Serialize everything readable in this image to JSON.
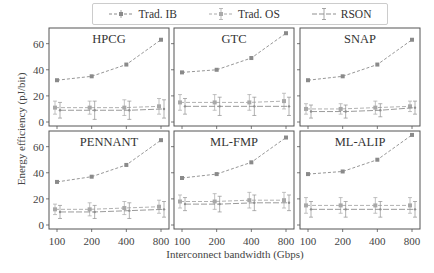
{
  "chart_data": {
    "type": "line",
    "layout": "2x3 small multiples",
    "xlabel": "Interconnect bandwidth (Gbps)",
    "ylabel": "Energy efficiency (pJ/bit)",
    "x": [
      100,
      200,
      400,
      800
    ],
    "xticks": [
      "100",
      "200",
      "400",
      "800"
    ],
    "yticks": [
      0,
      20,
      40,
      60
    ],
    "ylim": [
      0,
      72
    ],
    "grid": false,
    "legend_position": "top center",
    "legend": [
      "Trad. IB",
      "Trad. OS",
      "RSON"
    ],
    "colors": {
      "Trad. IB": "#8a8a8a",
      "Trad. OS": "#a0a0a0",
      "RSON": "#8f8f8f"
    },
    "panels": [
      {
        "title": "HPCG",
        "series": [
          {
            "name": "Trad. IB",
            "values": [
              32,
              35,
              44,
              63
            ]
          },
          {
            "name": "Trad. OS",
            "values": [
              11,
              11,
              11,
              12
            ],
            "error": [
              5,
              5,
              6,
              6
            ]
          },
          {
            "name": "RSON",
            "values": [
              9,
              9,
              9,
              10
            ],
            "error": [
              6,
              7,
              7,
              7
            ]
          }
        ]
      },
      {
        "title": "GTC",
        "series": [
          {
            "name": "Trad. IB",
            "values": [
              38,
              40,
              49,
              68
            ]
          },
          {
            "name": "Trad. OS",
            "values": [
              15,
              15,
              15,
              16
            ],
            "error": [
              6,
              6,
              6,
              6
            ]
          },
          {
            "name": "RSON",
            "values": [
              12,
              12,
              12,
              12
            ],
            "error": [
              6,
              7,
              7,
              7
            ]
          }
        ]
      },
      {
        "title": "SNAP",
        "series": [
          {
            "name": "Trad. IB",
            "values": [
              32,
              35,
              44,
              63
            ]
          },
          {
            "name": "Trad. OS",
            "values": [
              10,
              10,
              11,
              12
            ],
            "error": [
              4,
              4,
              5,
              4
            ]
          },
          {
            "name": "RSON",
            "values": [
              8,
              8,
              9,
              11
            ],
            "error": [
              5,
              5,
              5,
              5
            ]
          }
        ]
      },
      {
        "title": "PENNANT",
        "series": [
          {
            "name": "Trad. IB",
            "values": [
              33,
              37,
              46,
              65
            ]
          },
          {
            "name": "Trad. OS",
            "values": [
              12,
              12,
              13,
              14
            ],
            "error": [
              4,
              5,
              5,
              5
            ]
          },
          {
            "name": "RSON",
            "values": [
              10,
              10,
              11,
              12
            ],
            "error": [
              5,
              5,
              6,
              6
            ]
          }
        ]
      },
      {
        "title": "ML-FMP",
        "series": [
          {
            "name": "Trad. IB",
            "values": [
              36,
              39,
              48,
              67
            ]
          },
          {
            "name": "Trad. OS",
            "values": [
              18,
              18,
              19,
              19
            ],
            "error": [
              5,
              6,
              6,
              6
            ]
          },
          {
            "name": "RSON",
            "values": [
              16,
              16,
              17,
              17
            ],
            "error": [
              5,
              6,
              6,
              6
            ]
          }
        ]
      },
      {
        "title": "ML-ALIP",
        "series": [
          {
            "name": "Trad. IB",
            "values": [
              39,
              41,
              50,
              69
            ]
          },
          {
            "name": "Trad. OS",
            "values": [
              15,
              15,
              15,
              15
            ],
            "error": [
              6,
              6,
              6,
              6
            ]
          },
          {
            "name": "RSON",
            "values": [
              12,
              12,
              12,
              12
            ],
            "error": [
              6,
              6,
              6,
              6
            ]
          }
        ]
      }
    ]
  },
  "legend": {
    "items": [
      {
        "label": "Trad. IB"
      },
      {
        "label": "Trad. OS"
      },
      {
        "label": "RSON"
      }
    ]
  }
}
